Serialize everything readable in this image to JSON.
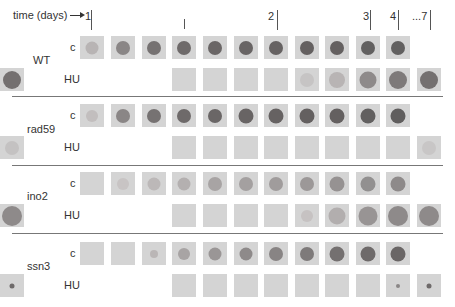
{
  "header": {
    "time_label": "time (days)",
    "day_markers": [
      {
        "label": "1",
        "text_x": 85,
        "tick_x": 91,
        "tick_top": 10,
        "tick_h": 20
      },
      {
        "label": "",
        "text_x": 0,
        "tick_x": 184,
        "tick_top": 19,
        "tick_h": 10
      },
      {
        "label": "2",
        "text_x": 268,
        "tick_x": 277,
        "tick_top": 10,
        "tick_h": 20
      },
      {
        "label": "3",
        "text_x": 363,
        "tick_x": 370,
        "tick_top": 10,
        "tick_h": 20
      },
      {
        "label": "4",
        "text_x": 390,
        "tick_x": 398,
        "tick_top": 10,
        "tick_h": 20
      },
      {
        "label": "...7",
        "text_x": 412,
        "tick_x": 430,
        "tick_top": 10,
        "tick_h": 20
      }
    ]
  },
  "columns_x": [
    80,
    111,
    142,
    172,
    203,
    234,
    264,
    295,
    325,
    356,
    386,
    417
  ],
  "strains": [
    {
      "name": "WT",
      "label_y": 54,
      "rows": [
        {
          "condition": "c",
          "y": 36,
          "start_col": 0,
          "colonies": [
            {
              "size": 13,
              "color": "#b8b4b4"
            },
            {
              "size": 14,
              "color": "#8a8686"
            },
            {
              "size": 14,
              "color": "#767272"
            },
            {
              "size": 14,
              "color": "#6e6a6a"
            },
            {
              "size": 14,
              "color": "#6a6666"
            },
            {
              "size": 14,
              "color": "#686464"
            },
            {
              "size": 14,
              "color": "#666262"
            },
            {
              "size": 14,
              "color": "#646060"
            },
            {
              "size": 14,
              "color": "#646060"
            },
            {
              "size": 14,
              "color": "#626060"
            },
            {
              "size": 14,
              "color": "#626060"
            }
          ]
        },
        {
          "condition": "HU",
          "y": 68,
          "start_col": 3,
          "colonies": [
            {
              "size": 0,
              "color": "#d4d4d4"
            },
            {
              "size": 0,
              "color": "#d4d4d4"
            },
            {
              "size": 0,
              "color": "#d4d4d4"
            },
            {
              "size": 0,
              "color": "#d4d4d4"
            },
            {
              "size": 14,
              "color": "#c6c4c4"
            },
            {
              "size": 16,
              "color": "#b8b4b4"
            },
            {
              "size": 17,
              "color": "#8e8a8a"
            },
            {
              "size": 18,
              "color": "#7e7a7a"
            },
            {
              "size": 18,
              "color": "#747070"
            },
            {
              "size": 18,
              "color": "#747070"
            }
          ]
        }
      ]
    },
    {
      "name": "rad59",
      "label_y": 123,
      "rows": [
        {
          "condition": "c",
          "y": 104,
          "start_col": 0,
          "colonies": [
            {
              "size": 12,
              "color": "#c2bebe"
            },
            {
              "size": 14,
              "color": "#8a8686"
            },
            {
              "size": 14,
              "color": "#767272"
            },
            {
              "size": 14,
              "color": "#6e6a6a"
            },
            {
              "size": 14,
              "color": "#6a6666"
            },
            {
              "size": 15,
              "color": "#686464"
            },
            {
              "size": 15,
              "color": "#666262"
            },
            {
              "size": 15,
              "color": "#646060"
            },
            {
              "size": 15,
              "color": "#646060"
            },
            {
              "size": 15,
              "color": "#626060"
            },
            {
              "size": 15,
              "color": "#605e5e"
            }
          ]
        },
        {
          "condition": "HU",
          "y": 136,
          "start_col": 3,
          "colonies": [
            {
              "size": 0,
              "color": "#d4d4d4"
            },
            {
              "size": 0,
              "color": "#d4d4d4"
            },
            {
              "size": 0,
              "color": "#d4d4d4"
            },
            {
              "size": 0,
              "color": "#d4d4d4"
            },
            {
              "size": 0,
              "color": "#d4d4d4"
            },
            {
              "size": 0,
              "color": "#d4d4d4"
            },
            {
              "size": 0,
              "color": "#d4d4d4"
            },
            {
              "size": 0,
              "color": "#d4d4d4"
            },
            {
              "size": 14,
              "color": "#c8c6c6"
            },
            {
              "size": 14,
              "color": "#c4c2c2"
            }
          ]
        }
      ]
    },
    {
      "name": "ino2",
      "label_y": 190,
      "rows": [
        {
          "condition": "c",
          "y": 172,
          "start_col": 0,
          "colonies": [
            {
              "size": 0,
              "color": "#d4d4d4"
            },
            {
              "size": 12,
              "color": "#c8c4c4"
            },
            {
              "size": 13,
              "color": "#bcb8b8"
            },
            {
              "size": 13,
              "color": "#b4b0b0"
            },
            {
              "size": 14,
              "color": "#a8a4a4"
            },
            {
              "size": 14,
              "color": "#a4a0a0"
            },
            {
              "size": 14,
              "color": "#a09c9c"
            },
            {
              "size": 14,
              "color": "#9c9898"
            },
            {
              "size": 15,
              "color": "#969292"
            },
            {
              "size": 15,
              "color": "#929090"
            },
            {
              "size": 15,
              "color": "#8e8a8a"
            }
          ]
        },
        {
          "condition": "HU",
          "y": 204,
          "start_col": 3,
          "colonies": [
            {
              "size": 0,
              "color": "#d4d4d4"
            },
            {
              "size": 0,
              "color": "#d4d4d4"
            },
            {
              "size": 0,
              "color": "#d4d4d4"
            },
            {
              "size": 0,
              "color": "#d4d4d4"
            },
            {
              "size": 12,
              "color": "#c6c2c2"
            },
            {
              "size": 17,
              "color": "#b2aeae"
            },
            {
              "size": 19,
              "color": "#989494"
            },
            {
              "size": 20,
              "color": "#8e8a8a"
            },
            {
              "size": 20,
              "color": "#8e8a8a"
            },
            {
              "size": 20,
              "color": "#8e8a8a"
            }
          ]
        }
      ]
    },
    {
      "name": "ssn3",
      "label_y": 260,
      "rows": [
        {
          "condition": "c",
          "y": 242,
          "start_col": 0,
          "colonies": [
            {
              "size": 0,
              "color": "#d4d4d4"
            },
            {
              "size": 0,
              "color": "#d4d4d4"
            },
            {
              "size": 8,
              "color": "#bab6b6"
            },
            {
              "size": 12,
              "color": "#a8a4a4"
            },
            {
              "size": 13,
              "color": "#9a9696"
            },
            {
              "size": 13,
              "color": "#8e8a8a"
            },
            {
              "size": 14,
              "color": "#888484"
            },
            {
              "size": 14,
              "color": "#7e7a7a"
            },
            {
              "size": 15,
              "color": "#747070"
            },
            {
              "size": 15,
              "color": "#6e6a6a"
            },
            {
              "size": 15,
              "color": "#6a6666"
            }
          ]
        },
        {
          "condition": "HU",
          "y": 274,
          "start_col": 3,
          "colonies": [
            {
              "size": 0,
              "color": "#d4d4d4"
            },
            {
              "size": 0,
              "color": "#d4d4d4"
            },
            {
              "size": 0,
              "color": "#d4d4d4"
            },
            {
              "size": 0,
              "color": "#d4d4d4"
            },
            {
              "size": 0,
              "color": "#d4d4d4"
            },
            {
              "size": 0,
              "color": "#d4d4d4"
            },
            {
              "size": 0,
              "color": "#d4d4d4"
            },
            {
              "size": 4,
              "color": "#8a8686"
            },
            {
              "size": 5,
              "color": "#6e6a6a"
            },
            {
              "size": 5,
              "color": "#6e6a6a"
            }
          ]
        }
      ]
    }
  ],
  "dividers_y": [
    96,
    165,
    233
  ]
}
